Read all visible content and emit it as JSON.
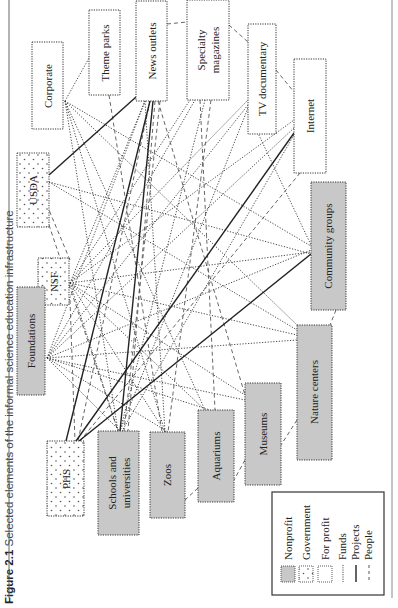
{
  "caption": {
    "figure_number": "Figure 2.1",
    "text": "Selected elements of the informal science education infrastructure"
  },
  "colors": {
    "nonprofit_fill": "#c8c8c8",
    "government_fill": "#ffffff",
    "for_profit_fill": "#ffffff",
    "border": "#333333",
    "line": "#333333",
    "background": "#ffffff"
  },
  "nodes": {
    "corporate": {
      "label": "Corporate",
      "type": "for_profit"
    },
    "theme_parks": {
      "label": "Theme parks",
      "type": "for_profit"
    },
    "news_outlets": {
      "label": "News outlets",
      "type": "for_profit"
    },
    "specialty_magazines": {
      "label_line1": "Specialty",
      "label_line2": "magazines",
      "type": "for_profit"
    },
    "tv_documentary": {
      "label": "TV documentary",
      "type": "for_profit"
    },
    "internet": {
      "label": "Internet",
      "type": "for_profit"
    },
    "usda": {
      "label": "USDA",
      "type": "government"
    },
    "nsf": {
      "label": "NSF",
      "type": "government"
    },
    "phs": {
      "label": "PHS",
      "type": "government"
    },
    "foundations": {
      "label": "Foundations",
      "type": "nonprofit"
    },
    "community_groups": {
      "label": "Community groups",
      "type": "nonprofit"
    },
    "nature_centers": {
      "label": "Nature centers",
      "type": "nonprofit"
    },
    "museums": {
      "label": "Museums",
      "type": "nonprofit"
    },
    "aquariums": {
      "label": "Aquariums",
      "type": "nonprofit"
    },
    "zoos": {
      "label": "Zoos",
      "type": "nonprofit"
    },
    "schools": {
      "label_line1": "Schools and",
      "label_line2": "universities",
      "type": "nonprofit"
    }
  },
  "legend": {
    "items": [
      {
        "label": "Nonprofit",
        "symbol": "grey-box"
      },
      {
        "label": "Government",
        "symbol": "stippled-box"
      },
      {
        "label": "For profit",
        "symbol": "white-box"
      },
      {
        "label": "Funds",
        "symbol": "dotted-line"
      },
      {
        "label": "Projects",
        "symbol": "solid-line"
      },
      {
        "label": "People",
        "symbol": "dashed-line"
      }
    ]
  },
  "edges": {
    "funds": [
      [
        "corporate",
        "theme_parks"
      ],
      [
        "corporate",
        "schools"
      ],
      [
        "corporate",
        "zoos"
      ],
      [
        "corporate",
        "museums"
      ],
      [
        "corporate",
        "community_groups"
      ],
      [
        "corporate",
        "nature_centers"
      ],
      [
        "usda",
        "community_groups"
      ],
      [
        "usda",
        "nature_centers"
      ],
      [
        "nsf",
        "news_outlets"
      ],
      [
        "nsf",
        "specialty_magazines"
      ],
      [
        "nsf",
        "tv_documentary"
      ],
      [
        "nsf",
        "internet"
      ],
      [
        "nsf",
        "community_groups"
      ],
      [
        "nsf",
        "nature_centers"
      ],
      [
        "nsf",
        "museums"
      ],
      [
        "nsf",
        "aquariums"
      ],
      [
        "nsf",
        "zoos"
      ],
      [
        "nsf",
        "schools"
      ],
      [
        "foundations",
        "news_outlets"
      ],
      [
        "foundations",
        "specialty_magazines"
      ],
      [
        "foundations",
        "tv_documentary"
      ],
      [
        "foundations",
        "internet"
      ],
      [
        "foundations",
        "community_groups"
      ],
      [
        "foundations",
        "nature_centers"
      ],
      [
        "foundations",
        "museums"
      ],
      [
        "foundations",
        "aquariums"
      ],
      [
        "foundations",
        "zoos"
      ],
      [
        "foundations",
        "schools"
      ],
      [
        "news_outlets",
        "zoos"
      ],
      [
        "specialty_magazines",
        "schools"
      ],
      [
        "tv_documentary",
        "schools"
      ],
      [
        "internet",
        "schools"
      ]
    ],
    "projects": [
      [
        "usda",
        "news_outlets"
      ],
      [
        "phs",
        "news_outlets"
      ],
      [
        "phs",
        "internet"
      ],
      [
        "phs",
        "community_groups"
      ],
      [
        "news_outlets",
        "schools"
      ]
    ],
    "people": [
      [
        "news_outlets",
        "specialty_magazines"
      ],
      [
        "specialty_magazines",
        "tv_documentary"
      ],
      [
        "tv_documentary",
        "internet"
      ],
      [
        "community_groups",
        "nature_centers"
      ],
      [
        "nature_centers",
        "museums"
      ],
      [
        "museums",
        "aquariums"
      ],
      [
        "aquariums",
        "zoos"
      ],
      [
        "theme_parks",
        "zoos"
      ],
      [
        "news_outlets",
        "museums"
      ],
      [
        "specialty_magazines",
        "aquariums"
      ],
      [
        "nsf",
        "usda"
      ],
      [
        "usda",
        "schools"
      ],
      [
        "nsf",
        "phs"
      ],
      [
        "news_outlets",
        "phs"
      ],
      [
        "specialty_magazines",
        "zoos"
      ],
      [
        "internet",
        "phs"
      ]
    ]
  }
}
